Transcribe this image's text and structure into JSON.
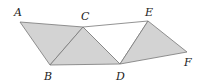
{
  "diagram": {
    "colors": {
      "shade": "#d3d3d3",
      "stroke": "#777777",
      "white": "#ffffff",
      "label": "#222222"
    },
    "points": {
      "A": {
        "x": 20,
        "y": 22,
        "label": "A",
        "lx": 14,
        "ly": 16
      },
      "C": {
        "x": 83,
        "y": 27,
        "label": "C",
        "lx": 81,
        "ly": 19
      },
      "B": {
        "x": 50,
        "y": 65,
        "label": "B",
        "lx": 44,
        "ly": 79
      },
      "E": {
        "x": 148,
        "y": 21,
        "label": "E",
        "lx": 145,
        "ly": 15
      },
      "F": {
        "x": 187,
        "y": 52,
        "label": "F",
        "lx": 184,
        "ly": 65
      },
      "D": {
        "x": 120,
        "y": 64,
        "label": "D",
        "lx": 116,
        "ly": 79
      }
    },
    "triangles": [
      {
        "name": "ACB",
        "fill": "shade"
      },
      {
        "name": "BCD",
        "fill": "shade"
      },
      {
        "name": "CED",
        "fill": "white"
      },
      {
        "name": "EFD",
        "fill": "shade"
      }
    ]
  }
}
